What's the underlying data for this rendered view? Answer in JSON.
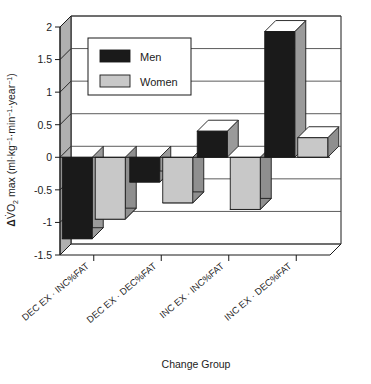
{
  "chart_data": {
    "type": "bar",
    "title": "",
    "subtitle": "",
    "xlabel": "Change Group",
    "ylabel": "ΔV̇O2 max (ml·kg−1·min−1·year−1)",
    "ylabel_parts": {
      "delta": "Δ",
      "vdot": "V̇",
      "o": "O",
      "two": "2",
      "max": " max (ml·kg",
      "exp1": "−1",
      "mid1": "·min",
      "exp2": "−1",
      "mid2": "·year",
      "exp3": "−1",
      "close": ")"
    },
    "categories": [
      "DEC EX · INC%FAT",
      "DEC EX · DEC%FAT",
      "INC EX · INC%FAT",
      "INC EX · DEC%FAT"
    ],
    "series": [
      {
        "name": "Men",
        "color": "#1a1a1a",
        "values": [
          -1.25,
          -0.38,
          0.4,
          1.93
        ]
      },
      {
        "name": "Women",
        "color": "#c8c8c8",
        "values": [
          -0.95,
          -0.7,
          -0.8,
          0.3
        ]
      }
    ],
    "ylim": [
      -1.5,
      2
    ],
    "ytick_values": [
      2,
      1.5,
      1,
      0.5,
      0,
      -0.5,
      -1,
      -1.5
    ],
    "ytick_labels": [
      "2",
      "1.5",
      "1",
      "0.5",
      "0",
      "-0.5",
      "-1",
      "-1.5"
    ],
    "grid": true,
    "grid_axis": "y",
    "legend_position": "upper-left",
    "style": "3d-bar",
    "zero_line": 0
  },
  "legend": {
    "entries": [
      {
        "label": "Men",
        "swatch_color": "#1a1a1a"
      },
      {
        "label": "Women",
        "swatch_color": "#c8c8c8"
      }
    ]
  },
  "colors": {
    "men": "#1a1a1a",
    "women": "#c8c8c8",
    "men_side": "#9a9a9a",
    "women_side": "#8f8f8f",
    "men_top": "#ffffff",
    "women_top": "#ffffff",
    "wall": "#b0b0b0",
    "floor": "#ffffff",
    "grid": "#4a4a4a",
    "outline": "#1a1a1a",
    "background": "#ffffff"
  }
}
